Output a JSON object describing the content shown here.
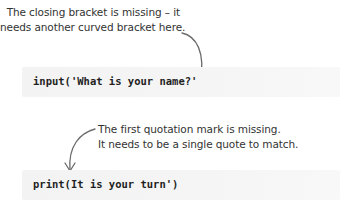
{
  "annotations": [
    {
      "lines": [
        "The closing bracket is missing – it",
        "needs another curved bracket here."
      ]
    },
    {
      "lines": [
        "The first quotation mark is missing.",
        "It needs to be a single quote to match."
      ]
    }
  ],
  "code_examples": [
    {
      "code": "input('What is your name?'"
    },
    {
      "code": "print(It is your turn')"
    }
  ],
  "icons": {
    "arrow_1": "curved-arrow-down-icon",
    "arrow_2": "curved-arrow-down-left-icon"
  },
  "colors": {
    "text": "#333333",
    "code_text": "#1f1f1f",
    "code_background": "#f4f4f4",
    "arrow": "#6a6a6a"
  }
}
